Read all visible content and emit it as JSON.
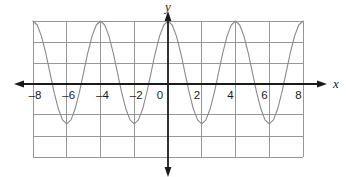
{
  "figure": {
    "title": "",
    "background_color": "#ffffff",
    "grid_color": "#8c8c8c",
    "axis_color": "#1a1a1a",
    "curve_color": "#8a8a8a"
  },
  "axes": {
    "x_axis_label": "x",
    "y_axis_label": "y",
    "x_tick_labels": [
      "–8",
      "–6",
      "–4",
      "–2",
      "0",
      "2",
      "4",
      "6",
      "8"
    ],
    "x_tick_values": [
      -8,
      -6,
      -4,
      -2,
      0,
      2,
      4,
      6,
      8
    ],
    "y_tick_labels": [],
    "arrows": [
      "x-left",
      "x-right",
      "y-up",
      "y-down"
    ]
  },
  "chart_data": {
    "type": "line",
    "title": "",
    "xlabel": "x",
    "ylabel": "y",
    "xlim": [
      -8,
      8
    ],
    "ylim": [
      -4.3,
      3
    ],
    "grid": true,
    "legend": false,
    "function": "y = 2.45 cos(pi x / 2) + 0.55",
    "period": 4,
    "amplitude": 2.45,
    "midline": 0.55,
    "maximum": 3,
    "minimum": -1.9,
    "x_of_maxima": [
      -8,
      -4,
      0,
      4,
      8
    ],
    "x_of_minima": [
      -6,
      -2,
      2,
      6
    ],
    "series": [
      {
        "name": "curve",
        "x": [
          -8,
          -7.75,
          -7.5,
          -7.25,
          -7,
          -6.75,
          -6.5,
          -6.25,
          -6,
          -5.75,
          -5.5,
          -5.25,
          -5,
          -4.75,
          -4.5,
          -4.25,
          -4,
          -3.75,
          -3.5,
          -3.25,
          -3,
          -2.75,
          -2.5,
          -2.25,
          -2,
          -1.75,
          -1.5,
          -1.25,
          -1,
          -0.75,
          -0.5,
          -0.25,
          0,
          0.25,
          0.5,
          0.75,
          1,
          1.25,
          1.5,
          1.75,
          2,
          2.25,
          2.5,
          2.75,
          3,
          3.25,
          3.5,
          3.75,
          4,
          4.25,
          4.5,
          4.75,
          5,
          5.25,
          5.5,
          5.75,
          6,
          6.25,
          6.5,
          6.75,
          7,
          7.25,
          7.5,
          7.75,
          8
        ],
        "y": [
          3,
          2.81,
          2.28,
          1.49,
          0.55,
          -0.39,
          -1.18,
          -1.71,
          -1.9,
          -1.71,
          -1.18,
          -0.39,
          0.55,
          1.49,
          2.28,
          2.81,
          3,
          2.81,
          2.28,
          1.49,
          0.55,
          -0.39,
          -1.18,
          -1.71,
          -1.9,
          -1.71,
          -1.18,
          -0.39,
          0.55,
          1.49,
          2.28,
          2.81,
          3,
          2.81,
          2.28,
          1.49,
          0.55,
          -0.39,
          -1.18,
          -1.71,
          -1.9,
          -1.71,
          -1.18,
          -0.39,
          0.55,
          1.49,
          2.28,
          2.81,
          3,
          2.81,
          2.28,
          1.49,
          0.55,
          -0.39,
          -1.18,
          -1.71,
          -1.9,
          -1.71,
          -1.18,
          -0.39,
          0.55,
          1.49,
          2.28,
          2.81,
          3
        ]
      }
    ]
  }
}
